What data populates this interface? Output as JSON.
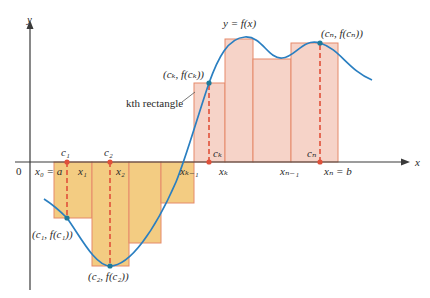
{
  "figure": {
    "colors": {
      "axis": "#3a3a3a",
      "curve": "#2a7fc1",
      "positive_fill": "#f6d3c8",
      "negative_fill": "#f3cc82",
      "rect_stroke": "#e58a6a",
      "sample_line": "#e0503a",
      "axis_point": "#e0503a",
      "curve_point": "#1f7a9a"
    },
    "axes": {
      "x_label": "x",
      "y_label": "y",
      "origin_label": "0"
    },
    "curve_label": "y = f(x)",
    "partition_labels": {
      "x0": "x₀ = a",
      "x1": "x₁",
      "x2": "x₂",
      "xk_minus_1": "xₖ₋₁",
      "xk": "xₖ",
      "xn_minus_1": "xₙ₋₁",
      "xn": "xₙ = b"
    },
    "sample_labels": {
      "c1": "c₁",
      "c2": "c₂",
      "ck": "cₖ",
      "cn": "cₙ"
    },
    "point_labels": {
      "p1": "(c₁, f(c₁))",
      "p2": "(c₂, f(c₂))",
      "pk": "(cₖ, f(cₖ))",
      "pn": "(cₙ, f(cₙ))"
    },
    "annotation": "kth rectangle",
    "rectangles": [
      {
        "x0": 54,
        "x1": 92,
        "sign": "negative",
        "edge": 218
      },
      {
        "x0": 92,
        "x1": 129,
        "sign": "negative",
        "edge": 266
      },
      {
        "x0": 129,
        "x1": 161,
        "sign": "negative",
        "edge": 243
      },
      {
        "x0": 161,
        "x1": 194,
        "sign": "negative",
        "edge": 203
      },
      {
        "x0": 194,
        "x1": 225,
        "sign": "positive",
        "edge": 83
      },
      {
        "x0": 225,
        "x1": 253,
        "sign": "positive",
        "edge": 39
      },
      {
        "x0": 253,
        "x1": 291,
        "sign": "positive",
        "edge": 59
      },
      {
        "x0": 291,
        "x1": 338,
        "sign": "positive",
        "edge": 43
      }
    ]
  }
}
